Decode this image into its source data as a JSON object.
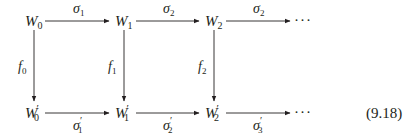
{
  "diagram": {
    "type": "commutative-diagram",
    "equation_number": "(9.18)",
    "top_row": [
      {
        "id": "W0",
        "base": "W",
        "sub": "0",
        "prime": ""
      },
      {
        "id": "W1",
        "base": "W",
        "sub": "1",
        "prime": ""
      },
      {
        "id": "W2",
        "base": "W",
        "sub": "2",
        "prime": ""
      }
    ],
    "bottom_row": [
      {
        "id": "W0p",
        "base": "W",
        "sub": "0",
        "prime": "′"
      },
      {
        "id": "W1p",
        "base": "W",
        "sub": "1",
        "prime": "′"
      },
      {
        "id": "W2p",
        "base": "W",
        "sub": "2",
        "prime": "′"
      }
    ],
    "continuation": "···",
    "top_arrows": [
      {
        "from": "W0",
        "to": "W1",
        "base": "σ",
        "sub": "1",
        "prime": ""
      },
      {
        "from": "W1",
        "to": "W2",
        "base": "σ",
        "sub": "2",
        "prime": ""
      },
      {
        "from": "W2",
        "to": "···",
        "base": "σ",
        "sub": "2",
        "prime": ""
      }
    ],
    "bottom_arrows": [
      {
        "from": "W0p",
        "to": "W1p",
        "base": "σ",
        "sub": "1",
        "prime": "′"
      },
      {
        "from": "W1p",
        "to": "W2p",
        "base": "σ",
        "sub": "2",
        "prime": "′"
      },
      {
        "from": "W2p",
        "to": "···",
        "base": "σ",
        "sub": "3",
        "prime": "′"
      }
    ],
    "vertical_arrows": [
      {
        "from": "W0",
        "to": "W0p",
        "base": "f",
        "sub": "0"
      },
      {
        "from": "W1",
        "to": "W1p",
        "base": "f",
        "sub": "1"
      },
      {
        "from": "W2",
        "to": "W2p",
        "base": "f",
        "sub": "2"
      }
    ]
  }
}
